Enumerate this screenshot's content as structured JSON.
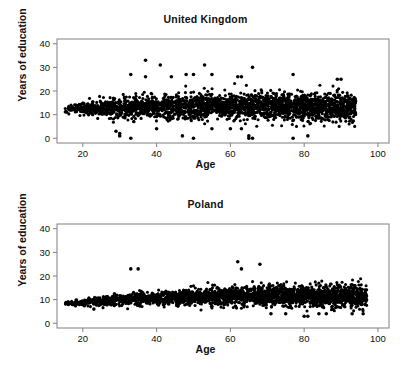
{
  "figure": {
    "background": "#ffffff",
    "ink": "#000000",
    "frame_color": "#808080",
    "point_color": "#000000"
  },
  "chart_data": [
    {
      "type": "scatter",
      "title": "United Kingdom",
      "xlabel": "Age",
      "ylabel": "Years of education",
      "xlim": [
        13,
        103
      ],
      "ylim": [
        -2,
        42
      ],
      "xticks": [
        20,
        40,
        60,
        80,
        100
      ],
      "yticks": [
        0,
        10,
        20,
        30,
        40
      ],
      "grid": false,
      "legend": "none",
      "n_points": 2400,
      "seed": 1337,
      "x_range": [
        15,
        94
      ],
      "band": {
        "center_start": 12.5,
        "center_end": 14.0,
        "spread_start": 2.0,
        "spread_end": 3.2
      },
      "outliers": [
        {
          "x": 37,
          "y": 33
        },
        {
          "x": 41,
          "y": 31
        },
        {
          "x": 53,
          "y": 31
        },
        {
          "x": 66,
          "y": 30
        },
        {
          "x": 33,
          "y": 27
        },
        {
          "x": 48,
          "y": 27
        },
        {
          "x": 50,
          "y": 27
        },
        {
          "x": 55,
          "y": 27
        },
        {
          "x": 77,
          "y": 27
        },
        {
          "x": 37,
          "y": 26
        },
        {
          "x": 44,
          "y": 26
        },
        {
          "x": 62,
          "y": 26
        },
        {
          "x": 63,
          "y": 26
        },
        {
          "x": 89,
          "y": 25
        },
        {
          "x": 90,
          "y": 25
        },
        {
          "x": 29,
          "y": 3
        },
        {
          "x": 30,
          "y": 1
        },
        {
          "x": 30,
          "y": 2
        },
        {
          "x": 33,
          "y": 0
        },
        {
          "x": 40,
          "y": 4
        },
        {
          "x": 47,
          "y": 1
        },
        {
          "x": 50,
          "y": 0
        },
        {
          "x": 55,
          "y": 4
        },
        {
          "x": 60,
          "y": 4
        },
        {
          "x": 63,
          "y": 4
        },
        {
          "x": 65,
          "y": 0
        },
        {
          "x": 65,
          "y": 1
        },
        {
          "x": 66,
          "y": 0
        },
        {
          "x": 77,
          "y": 0
        },
        {
          "x": 81,
          "y": 1
        },
        {
          "x": 93,
          "y": 14
        }
      ]
    },
    {
      "type": "scatter",
      "title": "Poland",
      "xlabel": "Age",
      "ylabel": "Years of education",
      "xlim": [
        13,
        103
      ],
      "ylim": [
        -2,
        42
      ],
      "xticks": [
        20,
        40,
        60,
        80,
        100
      ],
      "yticks": [
        0,
        10,
        20,
        30,
        40
      ],
      "grid": false,
      "legend": "none",
      "n_points": 2400,
      "seed": 90210,
      "x_range": [
        15,
        97
      ],
      "band": {
        "center_start": 8.5,
        "center_end": 12.5,
        "spread_start": 1.0,
        "spread_end": 2.6
      },
      "outliers": [
        {
          "x": 62,
          "y": 26
        },
        {
          "x": 68,
          "y": 25
        },
        {
          "x": 35,
          "y": 23
        },
        {
          "x": 33,
          "y": 23
        },
        {
          "x": 63,
          "y": 23
        },
        {
          "x": 23,
          "y": 6
        },
        {
          "x": 71,
          "y": 4
        },
        {
          "x": 75,
          "y": 4
        },
        {
          "x": 80,
          "y": 3
        },
        {
          "x": 81,
          "y": 3
        },
        {
          "x": 84,
          "y": 4
        },
        {
          "x": 86,
          "y": 4
        },
        {
          "x": 93,
          "y": 4
        },
        {
          "x": 96,
          "y": 4
        },
        {
          "x": 89,
          "y": 7
        },
        {
          "x": 91,
          "y": 7
        }
      ]
    }
  ]
}
